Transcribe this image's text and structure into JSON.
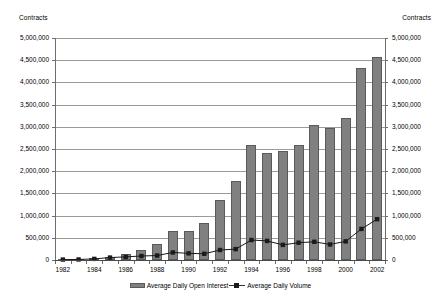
{
  "chart_data": {
    "type": "bar",
    "title": "",
    "xlabel": "",
    "ylabel": "Contracts",
    "y2label": "Contracts",
    "ylim": [
      0,
      5000000
    ],
    "y2lim": [
      0,
      5000000
    ],
    "grid": true,
    "legend_position": "bottom",
    "categories": [
      "1982",
      "1983",
      "1984",
      "1985",
      "1986",
      "1987",
      "1988",
      "1989",
      "1990",
      "1991",
      "1992",
      "1993",
      "1994",
      "1995",
      "1996",
      "1997",
      "1998",
      "1999",
      "2000",
      "2001",
      "2002"
    ],
    "x_tick_labels": [
      "1982",
      "",
      "1984",
      "",
      "1986",
      "",
      "1988",
      "",
      "1990",
      "",
      "1992",
      "",
      "1994",
      "",
      "1996",
      "",
      "1998",
      "",
      "2000",
      "",
      "2002"
    ],
    "y_tick_labels": [
      "0",
      "500,000",
      "1,000,000",
      "1,500,000",
      "2,000,000",
      "2,500,000",
      "3,000,000",
      "3,500,000",
      "4,000,000",
      "4,500,000",
      "5,000,000"
    ],
    "y2_tick_labels": [
      "0",
      "500,000",
      "1,000,000",
      "1,500,000",
      "2,000,000",
      "2,500,000",
      "3,000,000",
      "3,500,000",
      "4,000,000",
      "4,500,000",
      "5,000,000"
    ],
    "y_tick_values": [
      0,
      500000,
      1000000,
      1500000,
      2000000,
      2500000,
      3000000,
      3500000,
      4000000,
      4500000,
      5000000
    ],
    "series": [
      {
        "name": "Average Daily Open Interest",
        "type": "bar",
        "color": "#808080",
        "values": [
          20000,
          25000,
          40000,
          75000,
          140000,
          230000,
          360000,
          650000,
          655000,
          840000,
          1360000,
          1790000,
          2590000,
          2400000,
          2460000,
          2600000,
          3050000,
          2980000,
          3190000,
          4330000,
          4570000
        ]
      },
      {
        "name": "Average Daily Volume",
        "type": "line",
        "color": "#1a1a1a",
        "marker": "square",
        "values": [
          10000,
          12000,
          25000,
          55000,
          70000,
          90000,
          100000,
          170000,
          150000,
          140000,
          225000,
          245000,
          450000,
          430000,
          340000,
          390000,
          410000,
          350000,
          420000,
          700000,
          920000
        ]
      }
    ],
    "legend": [
      "Average Daily Open Interest",
      "Average Daily Volume"
    ]
  },
  "layout": {
    "plot_left": 55,
    "plot_right": 385,
    "plot_top": 38,
    "plot_bottom": 260,
    "bar_width": 10
  },
  "colors": {
    "bar_fill": "#808080",
    "bar_stroke": "#5a5a5a",
    "line": "#1a1a1a",
    "gridline": "#9a9a9a",
    "axis": "#6d6d6d"
  }
}
